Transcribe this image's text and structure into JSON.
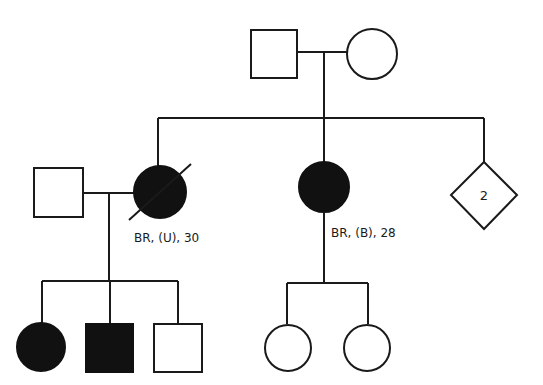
{
  "colors": {
    "affected": "#111111",
    "unaffected": "#ffffff",
    "line": "#1a1a1a"
  },
  "generations": [
    {
      "level": "I",
      "individuals": [
        {
          "id": "I-1",
          "sex": "male",
          "shape": "square",
          "affected": false
        },
        {
          "id": "I-2",
          "sex": "female",
          "shape": "circle",
          "affected": false
        }
      ]
    },
    {
      "level": "II",
      "individuals": [
        {
          "id": "II-1",
          "sex": "male",
          "shape": "square",
          "affected": false,
          "note": "married-in spouse"
        },
        {
          "id": "II-2",
          "sex": "female",
          "shape": "circle",
          "affected": true,
          "deceased": true,
          "label": "BR, (U), 30"
        },
        {
          "id": "II-3",
          "sex": "female",
          "shape": "circle",
          "affected": true,
          "deceased": false,
          "label": "BR, (B), 28"
        },
        {
          "id": "II-4",
          "sex": "unknown",
          "shape": "diamond",
          "affected": false,
          "count_label": "2"
        }
      ]
    },
    {
      "level": "III",
      "individuals": [
        {
          "id": "III-1",
          "sex": "female",
          "shape": "circle",
          "affected": true
        },
        {
          "id": "III-2",
          "sex": "male",
          "shape": "square",
          "affected": true
        },
        {
          "id": "III-3",
          "sex": "male",
          "shape": "square",
          "affected": false
        },
        {
          "id": "III-4",
          "sex": "female",
          "shape": "circle",
          "affected": false
        },
        {
          "id": "III-5",
          "sex": "female",
          "shape": "circle",
          "affected": false
        }
      ]
    }
  ],
  "labels": {
    "ii2": "BR, (U), 30",
    "ii3": "BR, (B), 28",
    "ii4_count": "2"
  }
}
